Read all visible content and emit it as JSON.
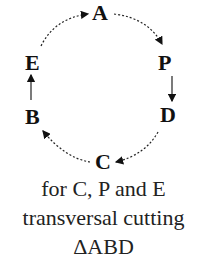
{
  "diagram": {
    "nodes": [
      {
        "id": "A",
        "label": "A"
      },
      {
        "id": "P",
        "label": "P"
      },
      {
        "id": "D",
        "label": "D"
      },
      {
        "id": "C",
        "label": "C"
      },
      {
        "id": "B",
        "label": "B"
      },
      {
        "id": "E",
        "label": "E"
      }
    ],
    "edges": [
      {
        "from": "E",
        "to": "A",
        "style": "dashed-arrow"
      },
      {
        "from": "A",
        "to": "P",
        "style": "dashed-arrow"
      },
      {
        "from": "P",
        "to": "D",
        "style": "solid-arrow"
      },
      {
        "from": "D",
        "to": "C",
        "style": "dashed-arrow"
      },
      {
        "from": "C",
        "to": "B",
        "style": "dashed-arrow"
      },
      {
        "from": "B",
        "to": "E",
        "style": "solid-arrow"
      }
    ]
  },
  "caption": {
    "line1": "for C, P and E",
    "line2": "transversal cutting",
    "line3": "ΔABD"
  }
}
